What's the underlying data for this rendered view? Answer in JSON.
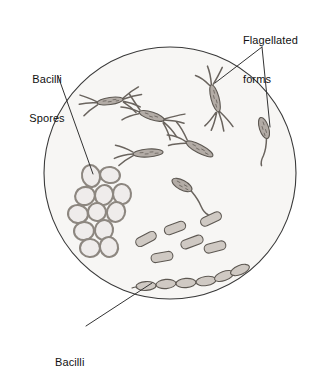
{
  "figure": {
    "kind": "microscopy-illustration",
    "field_of_view": {
      "shape": "circle",
      "center_x": 170,
      "center_y": 173,
      "radius": 126,
      "fill_color": "#f7f6f4",
      "stroke_color": "#3a3a3a"
    },
    "colors": {
      "cell_fill": "#b3aca6",
      "cell_fill_light": "#cfc9c3",
      "cell_stroke": "#5d5852",
      "flagella_stroke": "#6a645e",
      "spore_fill": "#efeceb",
      "spore_stroke": "#8d8780",
      "leader_line": "#333333",
      "text": "#111111",
      "background": "#ffffff"
    }
  },
  "labels": [
    {
      "id": "bacilli-spores",
      "line1": "Bacilli",
      "line2": "Spores",
      "anchor": "left",
      "points_to": "spore-cluster"
    },
    {
      "id": "flagellated-forms",
      "line1": "Flagellated",
      "line2": "forms",
      "anchor": "top-right",
      "points_to": "flagellated-cells"
    },
    {
      "id": "bacilli",
      "line1": "Bacilli",
      "line2": "",
      "anchor": "bottom-left",
      "points_to": "bacilli-chain"
    }
  ],
  "leader_lines": [
    {
      "id": "leader-spores",
      "from_x": 58,
      "from_y": 76,
      "to_x": 93,
      "to_y": 174
    },
    {
      "id": "leader-flagellated-left",
      "from_x": 262,
      "from_y": 47,
      "to_x": 215,
      "to_y": 83
    },
    {
      "id": "leader-flagellated-right",
      "from_x": 262,
      "from_y": 47,
      "to_x": 270,
      "to_y": 127
    },
    {
      "id": "leader-bacilli",
      "from_x": 86,
      "top_note": "text to chain",
      "from_y": 326,
      "to_x": 152,
      "to_y": 283
    }
  ],
  "specimens": {
    "flagellated_tuft": [
      {
        "id": "flag-1",
        "cx": 110,
        "cy": 100,
        "len": 26,
        "w": 7,
        "rot": -8
      },
      {
        "id": "flag-2",
        "cx": 152,
        "cy": 115,
        "len": 26,
        "w": 7,
        "rot": 18
      },
      {
        "id": "flag-3",
        "cx": 216,
        "cy": 98,
        "len": 28,
        "w": 8,
        "rot": 75
      },
      {
        "id": "flag-4",
        "cx": 148,
        "cy": 152,
        "len": 30,
        "w": 7,
        "rot": -4
      },
      {
        "id": "flag-5",
        "cx": 200,
        "cy": 148,
        "len": 30,
        "w": 8,
        "rot": 28
      }
    ],
    "monotrichous": [
      {
        "id": "mono-1",
        "cx": 264,
        "cy": 128,
        "len": 22,
        "w": 8,
        "rot": 72
      },
      {
        "id": "mono-2",
        "cx": 182,
        "cy": 185,
        "len": 22,
        "w": 9,
        "rot": 28
      }
    ],
    "spores": [
      {
        "id": "spore-1",
        "cx": 91,
        "cy": 176,
        "rx": 9,
        "ry": 11,
        "rot": -12
      },
      {
        "id": "spore-2",
        "cx": 110,
        "cy": 175,
        "rx": 10,
        "ry": 8,
        "rot": 8
      },
      {
        "id": "spore-3",
        "cx": 85,
        "cy": 196,
        "rx": 10,
        "ry": 9,
        "rot": -20
      },
      {
        "id": "spore-4",
        "cx": 104,
        "cy": 195,
        "rx": 9,
        "ry": 10,
        "rot": 15
      },
      {
        "id": "spore-5",
        "cx": 122,
        "cy": 194,
        "rx": 9,
        "ry": 10,
        "rot": -6
      },
      {
        "id": "spore-6",
        "cx": 78,
        "cy": 214,
        "rx": 10,
        "ry": 9,
        "rot": 10
      },
      {
        "id": "spore-7",
        "cx": 97,
        "cy": 212,
        "rx": 9,
        "ry": 9,
        "rot": -14
      },
      {
        "id": "spore-8",
        "cx": 116,
        "cy": 212,
        "rx": 9,
        "ry": 10,
        "rot": 18
      },
      {
        "id": "spore-9",
        "cx": 84,
        "cy": 231,
        "rx": 10,
        "ry": 9,
        "rot": -8
      },
      {
        "id": "spore-10",
        "cx": 104,
        "cy": 230,
        "rx": 9,
        "ry": 10,
        "rot": 12
      },
      {
        "id": "spore-11",
        "cx": 90,
        "cy": 248,
        "rx": 10,
        "ry": 9,
        "rot": 4
      },
      {
        "id": "spore-12",
        "cx": 109,
        "cy": 247,
        "rx": 9,
        "ry": 10,
        "rot": -16
      }
    ],
    "bacilli_rods": [
      {
        "id": "rod-1",
        "cx": 146,
        "cy": 239,
        "len": 22,
        "w": 9,
        "rot": -28
      },
      {
        "id": "rod-2",
        "cx": 175,
        "cy": 228,
        "len": 22,
        "w": 9,
        "rot": -20
      },
      {
        "id": "rod-3",
        "cx": 211,
        "cy": 219,
        "len": 22,
        "w": 9,
        "rot": -25
      },
      {
        "id": "rod-4",
        "cx": 192,
        "cy": 242,
        "len": 23,
        "w": 9,
        "rot": -20
      },
      {
        "id": "rod-5",
        "cx": 162,
        "cy": 257,
        "len": 22,
        "w": 9,
        "rot": -10
      },
      {
        "id": "rod-6",
        "cx": 215,
        "cy": 247,
        "len": 22,
        "w": 9,
        "rot": -14
      }
    ],
    "bacilli_chain": {
      "id": "chain-1",
      "segments": 6,
      "start_x": 140,
      "start_y": 287,
      "end_x": 240,
      "end_y": 272
    }
  }
}
